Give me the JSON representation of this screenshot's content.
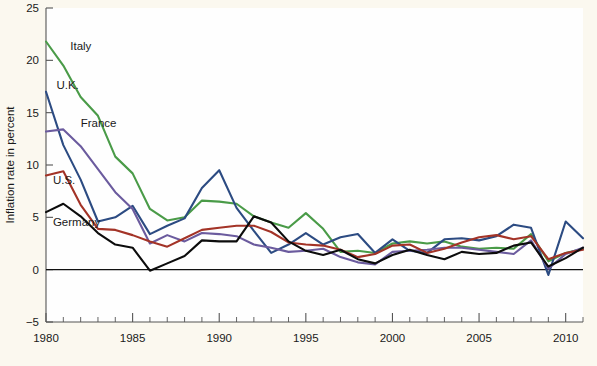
{
  "figure": {
    "background_color": "#fbf8ef",
    "plot_background_color": "#fefefe"
  },
  "chart_data": {
    "type": "line",
    "title": "",
    "subtitle": "",
    "xlabel": "",
    "ylabel": "Inflation rate in percent",
    "xlim": [
      1980,
      2011
    ],
    "ylim": [
      -5,
      25
    ],
    "xticks": [
      1980,
      1985,
      1990,
      1995,
      2000,
      2005,
      2010
    ],
    "xtick_labels": [
      "1980",
      "1985",
      "1990",
      "1995",
      "2000",
      "2005",
      "2010"
    ],
    "x_minor_tick_step": 1,
    "yticks": [
      -5,
      0,
      5,
      10,
      15,
      20,
      25
    ],
    "ytick_labels": [
      "−5",
      "0",
      "5",
      "10",
      "15",
      "20",
      "25"
    ],
    "grid": false,
    "legend_position": "inline-labels",
    "zero_line": true,
    "x": [
      1980,
      1981,
      1982,
      1983,
      1984,
      1985,
      1986,
      1987,
      1988,
      1989,
      1990,
      1991,
      1992,
      1993,
      1994,
      1995,
      1996,
      1997,
      1998,
      1999,
      2000,
      2001,
      2002,
      2003,
      2004,
      2005,
      2006,
      2007,
      2008,
      2009,
      2010,
      2011
    ],
    "series": [
      {
        "name": "Italy",
        "color": "#4a9b48",
        "label_x": 1981.4,
        "label_y": 21.0,
        "values": [
          21.8,
          19.5,
          16.5,
          14.7,
          10.8,
          9.2,
          5.8,
          4.7,
          5.0,
          6.6,
          6.5,
          6.3,
          5.1,
          4.5,
          4.0,
          5.4,
          3.9,
          1.7,
          1.8,
          1.6,
          2.5,
          2.7,
          2.5,
          2.7,
          2.2,
          2.0,
          2.1,
          2.0,
          3.4,
          0.8,
          1.6,
          2.0
        ]
      },
      {
        "name": "U.K.",
        "color": "#2c4b82",
        "label_x": 1980.6,
        "label_y": 17.3,
        "values": [
          17.0,
          11.9,
          8.6,
          4.6,
          5.0,
          6.1,
          3.4,
          4.2,
          4.9,
          7.8,
          9.5,
          5.9,
          3.7,
          1.6,
          2.4,
          3.5,
          2.4,
          3.1,
          3.4,
          1.6,
          2.9,
          1.8,
          1.6,
          2.9,
          3.0,
          2.8,
          3.2,
          4.3,
          4.0,
          -0.5,
          4.6,
          3.0
        ]
      },
      {
        "name": "France",
        "color": "#6b5b9e",
        "label_x": 1982.0,
        "label_y": 13.6,
        "values": [
          13.2,
          13.4,
          11.8,
          9.6,
          7.4,
          5.8,
          2.5,
          3.3,
          2.7,
          3.5,
          3.4,
          3.2,
          2.4,
          2.1,
          1.7,
          1.8,
          2.0,
          1.2,
          0.7,
          0.5,
          1.7,
          1.8,
          1.9,
          2.1,
          2.1,
          1.9,
          1.7,
          1.5,
          2.8,
          0.1,
          1.5,
          2.1
        ]
      },
      {
        "name": "U.S.",
        "color": "#a33327",
        "label_x": 1980.4,
        "label_y": 8.2,
        "values": [
          9.0,
          9.4,
          6.2,
          3.9,
          3.8,
          3.3,
          2.7,
          2.2,
          3.0,
          3.8,
          4.0,
          4.2,
          4.2,
          3.6,
          2.6,
          2.4,
          2.3,
          1.9,
          1.2,
          1.5,
          2.3,
          2.4,
          1.6,
          2.0,
          2.6,
          3.1,
          3.3,
          2.9,
          3.2,
          1.0,
          1.6,
          1.9
        ]
      },
      {
        "name": "Germany",
        "color": "#0c0c0c",
        "label_x": 1980.4,
        "label_y": 4.2,
        "values": [
          5.5,
          6.3,
          5.1,
          3.5,
          2.4,
          2.1,
          -0.1,
          0.6,
          1.3,
          2.8,
          2.7,
          2.7,
          5.1,
          4.5,
          2.7,
          1.8,
          1.4,
          1.9,
          1.0,
          0.6,
          1.4,
          1.9,
          1.4,
          1.0,
          1.7,
          1.5,
          1.6,
          2.3,
          2.6,
          0.3,
          1.1,
          2.1
        ]
      }
    ]
  }
}
